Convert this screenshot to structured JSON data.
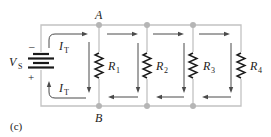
{
  "diagram": {
    "caption": "(c)",
    "source": {
      "symbol": "V",
      "subscript": "S",
      "neg_sign": "–",
      "pos_sign": "+"
    },
    "nodes": {
      "top": "A",
      "bottom": "B"
    },
    "current": {
      "symbol": "I",
      "subscript": "T"
    },
    "resistors": [
      {
        "symbol": "R",
        "subscript": "1"
      },
      {
        "symbol": "R",
        "subscript": "2"
      },
      {
        "symbol": "R",
        "subscript": "3"
      },
      {
        "symbol": "R",
        "subscript": "4"
      }
    ],
    "colors": {
      "wire": "#c2c2c2",
      "node": "#b5b5b5",
      "component": "#1a1a1a",
      "arrow": "#4a4a4a"
    }
  }
}
